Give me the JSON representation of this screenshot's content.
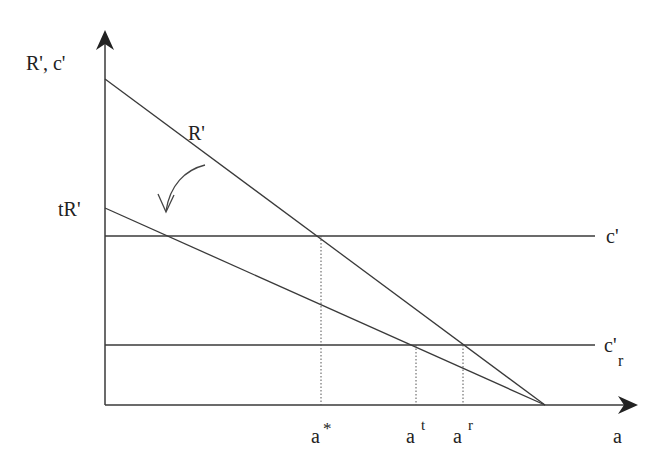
{
  "diagram": {
    "colors": {
      "line": "#3a3a3a",
      "background": "#ffffff"
    },
    "axes": {
      "y_label": "R', c'",
      "x_label": "a"
    },
    "curves": {
      "R_prime": {
        "label": "R'"
      },
      "tR_prime": {
        "label": "tR'"
      },
      "c_prime": {
        "label": "c'"
      },
      "c_prime_r": {
        "label": "c'",
        "subscript": "r"
      }
    },
    "x_markers": [
      {
        "base": "a",
        "sup": "*"
      },
      {
        "base": "a",
        "sup": "t"
      },
      {
        "base": "a",
        "sup": "r"
      }
    ],
    "annotation": {
      "arrow": "rotation-arrow"
    }
  }
}
